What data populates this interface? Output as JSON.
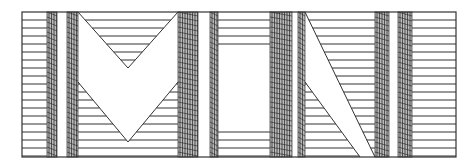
{
  "artwork": {
    "title": "MIN",
    "letters": [
      "M",
      "I",
      "N"
    ],
    "colors": {
      "background": "#ffffff",
      "line": "#333333",
      "hatch": "#444444"
    },
    "frame": {
      "x": 22,
      "y": 12,
      "w": 434,
      "h": 145
    },
    "hatched_columns": [
      {
        "x": 47,
        "w": 10
      },
      {
        "x": 67,
        "w": 11
      },
      {
        "x": 178,
        "w": 20
      },
      {
        "x": 210,
        "w": 8
      },
      {
        "x": 270,
        "w": 22
      },
      {
        "x": 298,
        "w": 7
      },
      {
        "x": 375,
        "w": 14
      },
      {
        "x": 398,
        "w": 14
      }
    ],
    "line_spacing": 8
  }
}
